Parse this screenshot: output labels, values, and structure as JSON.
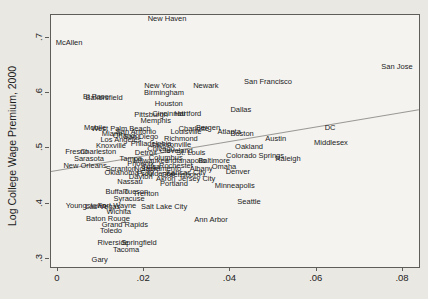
{
  "figure": {
    "background": "#eae8e3",
    "plot_background": "#f4f3f0",
    "border_color": "#5f5d5a",
    "text_color": "#1c1c1c",
    "trend_line_color": "#9a9894"
  },
  "chart_data": {
    "type": "scatter",
    "title": "",
    "xlabel": "",
    "ylabel": "Log College Wage Premium, 2000",
    "marker_style": "city-name-text-labels",
    "grid": false,
    "legend": false,
    "xlim": [
      -0.0016,
      0.0837
    ],
    "ylim": [
      0.2855,
      0.7416
    ],
    "x_ticks": {
      "values": [
        0,
        0.02,
        0.04,
        0.06,
        0.08
      ],
      "labels": [
        "0",
        ".02",
        ".04",
        ".06",
        ".08"
      ]
    },
    "y_ticks": {
      "values": [
        0.3,
        0.4,
        0.5,
        0.6,
        0.7
      ],
      "labels": [
        ".3",
        ".4",
        ".5",
        ".6",
        ".7"
      ]
    },
    "trend_line": {
      "x1": -0.0016,
      "y1": 0.46,
      "x2": 0.0837,
      "y2": 0.572
    },
    "points": [
      {
        "name": "New Haven",
        "x": 0.0253,
        "y": 0.734
      },
      {
        "name": "McAllen",
        "x": 0.0026,
        "y": 0.691
      },
      {
        "name": "San Jose",
        "x": 0.0786,
        "y": 0.648
      },
      {
        "name": "San Francisco",
        "x": 0.0487,
        "y": 0.62
      },
      {
        "name": "New York",
        "x": 0.0237,
        "y": 0.613
      },
      {
        "name": "Newark",
        "x": 0.0343,
        "y": 0.613
      },
      {
        "name": "Birmingham",
        "x": 0.0246,
        "y": 0.6
      },
      {
        "name": "El Paso",
        "x": 0.0088,
        "y": 0.593
      },
      {
        "name": "Bakersfield",
        "x": 0.0107,
        "y": 0.592
      },
      {
        "name": "Houston",
        "x": 0.0257,
        "y": 0.581
      },
      {
        "name": "Dallas",
        "x": 0.0424,
        "y": 0.57
      },
      {
        "name": "Pittsburgh",
        "x": 0.0216,
        "y": 0.561
      },
      {
        "name": "Cincinnati",
        "x": 0.0257,
        "y": 0.562
      },
      {
        "name": "Hartford",
        "x": 0.0301,
        "y": 0.562
      },
      {
        "name": "Memphis",
        "x": 0.0227,
        "y": 0.55
      },
      {
        "name": "Mobile",
        "x": 0.0086,
        "y": 0.537
      },
      {
        "name": "West Palm Beach",
        "x": 0.0146,
        "y": 0.536
      },
      {
        "name": "Bergen",
        "x": 0.0348,
        "y": 0.537
      },
      {
        "name": "Charlotte",
        "x": 0.0315,
        "y": 0.535
      },
      {
        "name": "Louisville",
        "x": 0.0297,
        "y": 0.53
      },
      {
        "name": "Atlanta",
        "x": 0.0397,
        "y": 0.53
      },
      {
        "name": "Boston",
        "x": 0.0427,
        "y": 0.527
      },
      {
        "name": "Miami",
        "x": 0.0125,
        "y": 0.526
      },
      {
        "name": "San Antonio",
        "x": 0.0181,
        "y": 0.53
      },
      {
        "name": "Orlando",
        "x": 0.0158,
        "y": 0.523
      },
      {
        "name": "San Diego",
        "x": 0.0192,
        "y": 0.521
      },
      {
        "name": "Los Angeles",
        "x": 0.0146,
        "y": 0.515
      },
      {
        "name": "Richmond",
        "x": 0.0285,
        "y": 0.517
      },
      {
        "name": "Philadelphia",
        "x": 0.0216,
        "y": 0.508
      },
      {
        "name": "Jacksonville",
        "x": 0.0262,
        "y": 0.506
      },
      {
        "name": "Knoxville",
        "x": 0.0123,
        "y": 0.505
      },
      {
        "name": "Chicago",
        "x": 0.0239,
        "y": 0.499
      },
      {
        "name": "Cleveland",
        "x": 0.0274,
        "y": 0.495
      },
      {
        "name": "Detroit",
        "x": 0.0204,
        "y": 0.492
      },
      {
        "name": "St. Louis",
        "x": 0.0308,
        "y": 0.492
      },
      {
        "name": "Fresno",
        "x": 0.0044,
        "y": 0.494
      },
      {
        "name": "Charleston",
        "x": 0.0093,
        "y": 0.494
      },
      {
        "name": "Columbus",
        "x": 0.025,
        "y": 0.483
      },
      {
        "name": "Sarasota",
        "x": 0.0072,
        "y": 0.481
      },
      {
        "name": "Tampa",
        "x": 0.0169,
        "y": 0.481
      },
      {
        "name": "Milwaukee",
        "x": 0.0216,
        "y": 0.477
      },
      {
        "name": "Indianapolis",
        "x": 0.0297,
        "y": 0.477
      },
      {
        "name": "Baltimore",
        "x": 0.0362,
        "y": 0.477
      },
      {
        "name": "Phoenix",
        "x": 0.0192,
        "y": 0.472
      },
      {
        "name": "Rochester",
        "x": 0.0274,
        "y": 0.468
      },
      {
        "name": "New Orleans",
        "x": 0.0063,
        "y": 0.468
      },
      {
        "name": "Omaha",
        "x": 0.0385,
        "y": 0.467
      },
      {
        "name": "Albany",
        "x": 0.0332,
        "y": 0.462
      },
      {
        "name": "Sacramento",
        "x": 0.0239,
        "y": 0.462
      },
      {
        "name": "Norfolk",
        "x": 0.0204,
        "y": 0.462
      },
      {
        "name": "Scranton",
        "x": 0.0146,
        "y": 0.462
      },
      {
        "name": "Tulsa",
        "x": 0.0216,
        "y": 0.466
      },
      {
        "name": "Denver",
        "x": 0.0417,
        "y": 0.457
      },
      {
        "name": "Oklahoma City",
        "x": 0.0165,
        "y": 0.456
      },
      {
        "name": "Kansas City",
        "x": 0.0297,
        "y": 0.456
      },
      {
        "name": "Providence",
        "x": 0.0227,
        "y": 0.453
      },
      {
        "name": "Greensboro",
        "x": 0.0285,
        "y": 0.452
      },
      {
        "name": "Dayton",
        "x": 0.0192,
        "y": 0.448
      },
      {
        "name": "Jersey City",
        "x": 0.0322,
        "y": 0.445
      },
      {
        "name": "Akron",
        "x": 0.025,
        "y": 0.444
      },
      {
        "name": "Nassau",
        "x": 0.0167,
        "y": 0.439
      },
      {
        "name": "Portland",
        "x": 0.0269,
        "y": 0.436
      },
      {
        "name": "Minneapolis",
        "x": 0.041,
        "y": 0.432
      },
      {
        "name": "DC",
        "x": 0.0631,
        "y": 0.537
      },
      {
        "name": "Austin",
        "x": 0.0505,
        "y": 0.517
      },
      {
        "name": "Middlesex",
        "x": 0.0633,
        "y": 0.51
      },
      {
        "name": "Oakland",
        "x": 0.0443,
        "y": 0.503
      },
      {
        "name": "Colorado Springs",
        "x": 0.0457,
        "y": 0.486
      },
      {
        "name": "Raleigh",
        "x": 0.0533,
        "y": 0.481
      },
      {
        "name": "Buffalo",
        "x": 0.0137,
        "y": 0.421
      },
      {
        "name": "Tucson",
        "x": 0.0181,
        "y": 0.421
      },
      {
        "name": "Trenton",
        "x": 0.0204,
        "y": 0.418
      },
      {
        "name": "Syracuse",
        "x": 0.0165,
        "y": 0.409
      },
      {
        "name": "Seattle",
        "x": 0.0443,
        "y": 0.403
      },
      {
        "name": "Youngstown",
        "x": 0.0065,
        "y": 0.396
      },
      {
        "name": "Las Vegas",
        "x": 0.0104,
        "y": 0.394
      },
      {
        "name": "Fort Wayne",
        "x": 0.0137,
        "y": 0.396
      },
      {
        "name": "Salt Lake City",
        "x": 0.0246,
        "y": 0.394
      },
      {
        "name": "Wichita",
        "x": 0.0141,
        "y": 0.385
      },
      {
        "name": "Ann Arbor",
        "x": 0.0355,
        "y": 0.371
      },
      {
        "name": "Baton Rouge",
        "x": 0.0116,
        "y": 0.372
      },
      {
        "name": "Grand Rapids",
        "x": 0.0155,
        "y": 0.362
      },
      {
        "name": "Toledo",
        "x": 0.0123,
        "y": 0.351
      },
      {
        "name": "Riverside",
        "x": 0.0128,
        "y": 0.329
      },
      {
        "name": "Springfield",
        "x": 0.0188,
        "y": 0.329
      },
      {
        "name": "Tacoma",
        "x": 0.0158,
        "y": 0.316
      },
      {
        "name": "Gary",
        "x": 0.0097,
        "y": 0.298
      }
    ]
  }
}
